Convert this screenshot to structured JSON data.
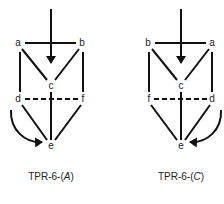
{
  "diagrams": [
    {
      "caption_prefix": "TPR-6-(",
      "caption_italic": "A",
      "caption_suffix": ")",
      "nodes": {
        "a": {
          "label": "a",
          "x": 18,
          "y": 43
        },
        "b": {
          "label": "b",
          "x": 82,
          "y": 43
        },
        "c": {
          "label": "c",
          "x": 51,
          "y": 86
        },
        "d": {
          "label": "d",
          "x": 18,
          "y": 99
        },
        "f": {
          "label": "f",
          "x": 83,
          "y": 99
        },
        "e": {
          "label": "e",
          "x": 51,
          "y": 146
        }
      },
      "solid_edges": [
        [
          "a",
          "b"
        ],
        [
          "a",
          "c"
        ],
        [
          "b",
          "c"
        ],
        [
          "a",
          "d"
        ],
        [
          "b",
          "f"
        ],
        [
          "c",
          "e"
        ],
        [
          "d",
          "e"
        ],
        [
          "f",
          "e"
        ]
      ],
      "dashed_edges": [
        [
          "d",
          "f"
        ]
      ],
      "arrows": [
        "incoming arrow from top to c",
        "curved arrow from d to e (left side)"
      ]
    },
    {
      "caption_prefix": "TPR-6-(",
      "caption_italic": "C",
      "caption_suffix": ")",
      "nodes": {
        "b": {
          "label": "b",
          "x": 148,
          "y": 43
        },
        "a": {
          "label": "a",
          "x": 212,
          "y": 43
        },
        "c": {
          "label": "c",
          "x": 181,
          "y": 86
        },
        "f": {
          "label": "f",
          "x": 149,
          "y": 99
        },
        "d": {
          "label": "d",
          "x": 212,
          "y": 99
        },
        "e": {
          "label": "e",
          "x": 181,
          "y": 146
        }
      },
      "solid_edges": [
        [
          "b",
          "a"
        ],
        [
          "b",
          "c"
        ],
        [
          "a",
          "c"
        ],
        [
          "b",
          "f"
        ],
        [
          "a",
          "d"
        ],
        [
          "c",
          "e"
        ],
        [
          "f",
          "e"
        ],
        [
          "d",
          "e"
        ]
      ],
      "dashed_edges": [
        [
          "f",
          "d"
        ]
      ],
      "arrows": [
        "incoming arrow from top to c",
        "curved arrow from d to e (right side)"
      ]
    }
  ],
  "colors": {
    "stroke": "#111111",
    "text": "#222222",
    "background": "#ffffff"
  }
}
